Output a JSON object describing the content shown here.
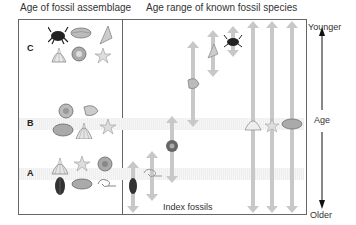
{
  "headers": {
    "left": "Age of fossil assemblage",
    "right": "Age range of known fossil species"
  },
  "assemblages": [
    {
      "label": "C",
      "fossils": [
        "crab",
        "clam",
        "cone-snail",
        "scallop",
        "ammonite-snail",
        "starfish"
      ]
    },
    {
      "label": "B",
      "fossils": [
        "ammonite",
        "snail",
        "clam",
        "scallop",
        "starfish"
      ]
    },
    {
      "label": "A",
      "fossils": [
        "scallop",
        "starfish",
        "ammonite",
        "trilobite",
        "clam",
        "coiled-worm"
      ]
    }
  ],
  "axis": {
    "top": "Younger",
    "middle": "Age",
    "bottom": "Older"
  },
  "index_label": "Index fossils",
  "colors": {
    "box_border": "#666666",
    "range_arrow": "#c8c8c8",
    "band": "#eeeeee",
    "text": "#333333"
  },
  "species_ranges": [
    {
      "fossil": "trilobite",
      "x": 133,
      "top": 162,
      "bottom": 212
    },
    {
      "fossil": "coiled-worm",
      "x": 152,
      "top": 152,
      "bottom": 200
    },
    {
      "fossil": "ammonite",
      "x": 172,
      "top": 117,
      "bottom": 182
    },
    {
      "fossil": "snail",
      "x": 193,
      "top": 42,
      "bottom": 126
    },
    {
      "fossil": "cone-snail",
      "x": 213,
      "top": 31,
      "bottom": 76
    },
    {
      "fossil": "crab",
      "x": 233,
      "top": 27,
      "bottom": 56
    },
    {
      "fossil": "scallop",
      "x": 253,
      "top": 22,
      "bottom": 212
    },
    {
      "fossil": "starfish",
      "x": 272,
      "top": 22,
      "bottom": 212
    },
    {
      "fossil": "clam",
      "x": 292,
      "top": 22,
      "bottom": 212
    }
  ]
}
